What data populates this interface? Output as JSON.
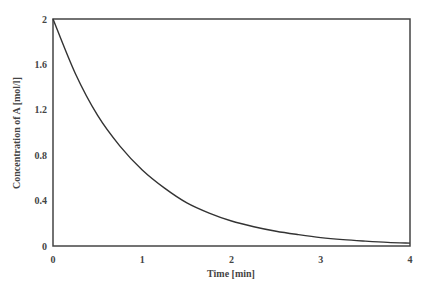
{
  "chart_data": {
    "type": "line",
    "title": "",
    "xlabel": "Time [min]",
    "ylabel": "Concentration of A [mol/l]",
    "xlim": [
      0,
      4
    ],
    "ylim": [
      0,
      2
    ],
    "x_ticks": [
      0,
      1,
      2,
      3,
      4
    ],
    "x_tick_labels": [
      "0",
      "1",
      "2",
      "3",
      "4"
    ],
    "y_ticks": [
      0,
      0.4,
      0.8,
      1.2,
      1.6,
      2
    ],
    "y_tick_labels": [
      "0",
      "0.4",
      "0.8",
      "1.2",
      "1.6",
      "2"
    ],
    "grid": false,
    "legend": null,
    "series": [
      {
        "name": "Concentration of A",
        "color": "#333333",
        "x": [
          0,
          0.25,
          0.5,
          0.75,
          1,
          1.25,
          1.5,
          1.75,
          2,
          2.25,
          2.5,
          2.75,
          3,
          3.25,
          3.5,
          3.75,
          4
        ],
        "y": [
          2.0,
          1.52,
          1.15,
          0.88,
          0.67,
          0.51,
          0.38,
          0.29,
          0.22,
          0.17,
          0.13,
          0.1,
          0.074,
          0.056,
          0.043,
          0.032,
          0.025
        ]
      }
    ]
  },
  "style": {
    "axis_color": "#444444",
    "line_color": "#333333",
    "background": "#ffffff"
  }
}
